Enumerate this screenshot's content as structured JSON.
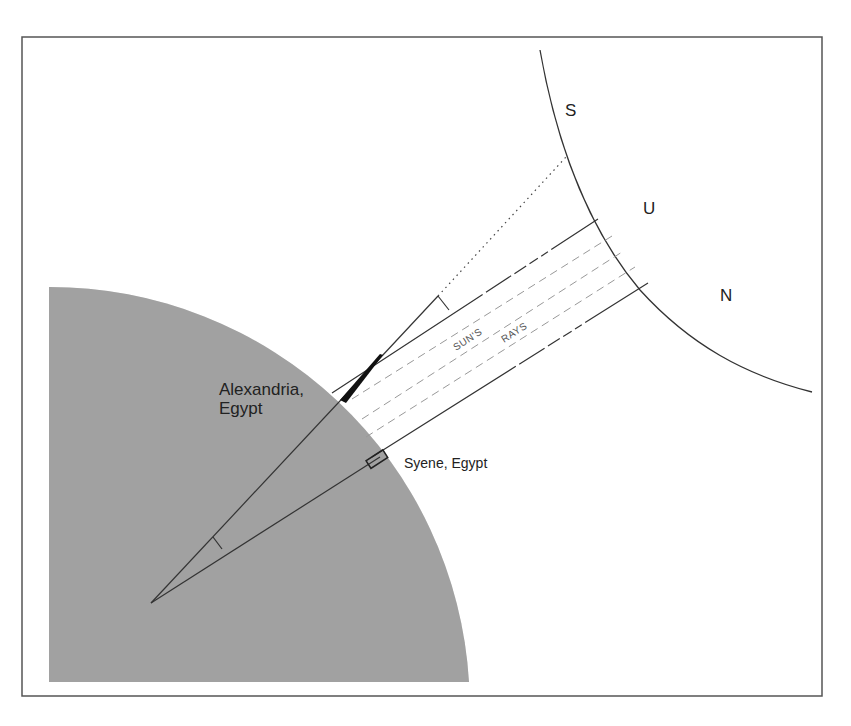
{
  "diagram": {
    "sun": {
      "letters": [
        "S",
        "U",
        "N"
      ],
      "label_color": "#222222"
    },
    "earth": {
      "fill_color": "#a3a3a3"
    },
    "labels": {
      "alexandria_line1": "Alexandria,",
      "alexandria_line2": "Egypt",
      "syene": "Syene, Egypt",
      "suns": "SUN'S",
      "rays": "RAYS"
    },
    "colors": {
      "frame": "#555555",
      "line": "#333333",
      "dashed_ray": "#999999",
      "background": "#ffffff"
    },
    "elements": [
      "frame",
      "earth-quadrant",
      "sun-arc",
      "sun-ray-upper-boundary",
      "sun-ray-lower-boundary",
      "sun-ray-dashed-1",
      "sun-ray-dashed-2",
      "sun-ray-dashed-3",
      "alexandria-gnomon",
      "alexandria-radius-line",
      "dotted-extension-line",
      "syene-well",
      "syene-radius-line",
      "angle-marker-center",
      "angle-marker-gnomon"
    ]
  }
}
